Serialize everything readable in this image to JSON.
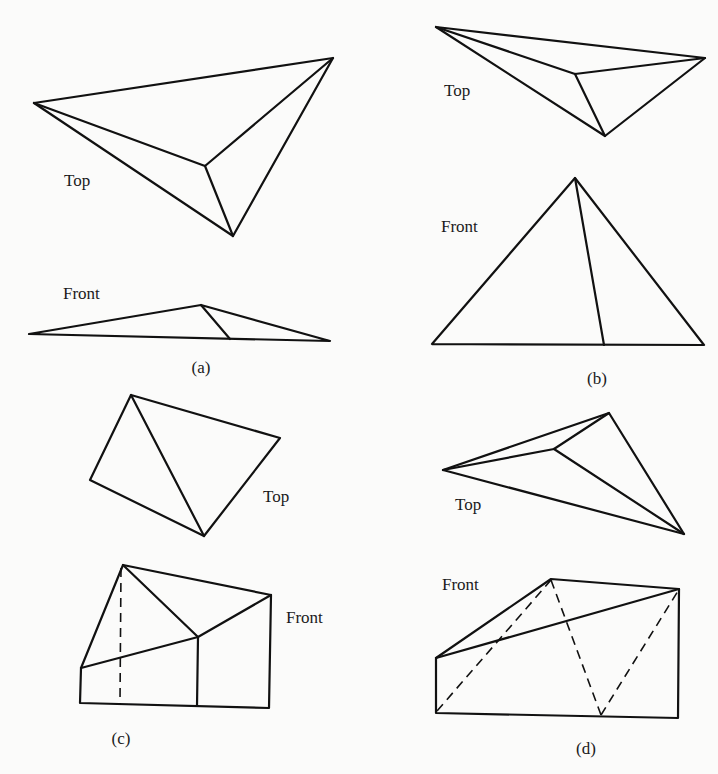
{
  "figures": [
    {
      "id": "a",
      "caption": "(a)",
      "top_label": "Top",
      "front_label": "Front",
      "top_view": {
        "vertices": {
          "left": [
            34,
            103
          ],
          "top_right": [
            333,
            58
          ],
          "inner": [
            205,
            166
          ],
          "bottom": [
            233,
            236
          ]
        },
        "edges": [
          [
            "left",
            "top_right"
          ],
          [
            "left",
            "inner"
          ],
          [
            "left",
            "bottom"
          ],
          [
            "inner",
            "top_right"
          ],
          [
            "inner",
            "bottom"
          ],
          [
            "bottom",
            "top_right"
          ]
        ]
      },
      "front_view": {
        "vertices": {
          "left": [
            29,
            334
          ],
          "apex": [
            201,
            305
          ],
          "inner_base": [
            230,
            339
          ],
          "right": [
            330,
            341
          ]
        },
        "edges": [
          [
            "left",
            "apex"
          ],
          [
            "apex",
            "right"
          ],
          [
            "apex",
            "inner_base"
          ],
          [
            "left",
            "right"
          ]
        ]
      }
    },
    {
      "id": "b",
      "caption": "(b)",
      "top_label": "Top",
      "front_label": "Front"
    },
    {
      "id": "c",
      "caption": "(c)",
      "top_label": "Top",
      "front_label": "Front"
    },
    {
      "id": "d",
      "caption": "(d)",
      "top_label": "Top",
      "front_label": "Front"
    }
  ],
  "colors": {
    "line": "#111111",
    "background": "#fbfbfa",
    "text": "#1a1a1a"
  }
}
